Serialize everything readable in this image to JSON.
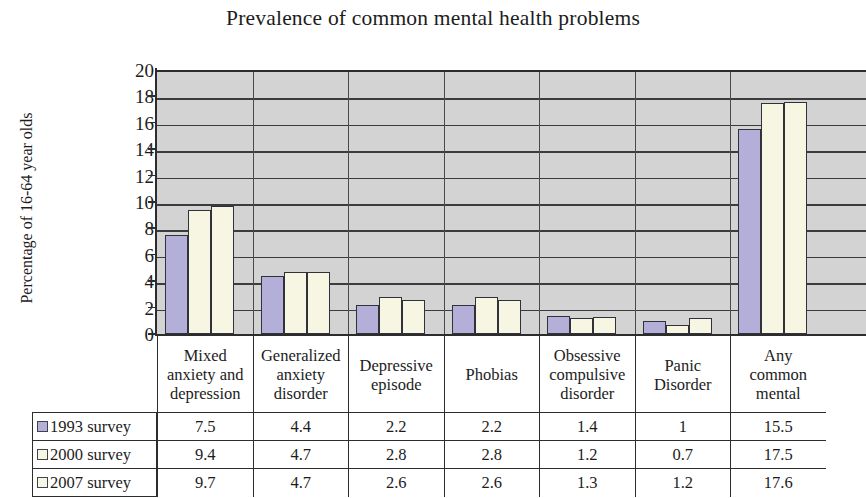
{
  "chart_data": {
    "type": "bar",
    "title": "Prevalence of common mental health problems",
    "xlabel": "",
    "ylabel": "Percentage of 16-64 year olds",
    "ylim": [
      0,
      20
    ],
    "ytick_step": 2,
    "yticks": [
      "20",
      "18",
      "16",
      "14",
      "12",
      "10",
      "8",
      "6",
      "4",
      "2",
      "0"
    ],
    "grid": true,
    "legend_position": "table-left",
    "categories": [
      "Mixed anxiety and depression",
      "Generalized anxiety disorder",
      "Depressive episode",
      "Phobias",
      "Obsessive compulsive disorder",
      "Panic Disorder",
      "Any common mental"
    ],
    "category_lines": [
      [
        "Mixed",
        "anxiety and",
        "depression"
      ],
      [
        "Generalized",
        "anxiety",
        "disorder"
      ],
      [
        "Depressive",
        "episode"
      ],
      [
        "Phobias"
      ],
      [
        "Obsessive",
        "compulsive",
        "disorder"
      ],
      [
        "Panic",
        "Disorder"
      ],
      [
        "Any",
        "common",
        "mental"
      ]
    ],
    "series": [
      {
        "name": "1993 survey",
        "color": "#b4afd9",
        "values": [
          7.5,
          4.4,
          2.2,
          2.2,
          1.4,
          1,
          15.5
        ],
        "display_values": [
          "7.5",
          "4.4",
          "2.2",
          "2.2",
          "1.4",
          "1",
          "15.5"
        ]
      },
      {
        "name": "2000 survey",
        "color": "#f6f6e2",
        "values": [
          9.4,
          4.7,
          2.8,
          2.8,
          1.2,
          0.7,
          17.5
        ],
        "display_values": [
          "9.4",
          "4.7",
          "2.8",
          "2.8",
          "1.2",
          "0.7",
          "17.5"
        ]
      },
      {
        "name": "2007 survey",
        "color": "#f6f6e2",
        "values": [
          9.7,
          4.7,
          2.6,
          2.6,
          1.3,
          1.2,
          17.6
        ],
        "display_values": [
          "9.7",
          "4.7",
          "2.6",
          "2.6",
          "1.3",
          "1.2",
          "17.6"
        ]
      }
    ],
    "plot_background": "#d3d3d3",
    "gridline_color": "#3c3c3c",
    "axis_color": "#2d2d2d"
  }
}
